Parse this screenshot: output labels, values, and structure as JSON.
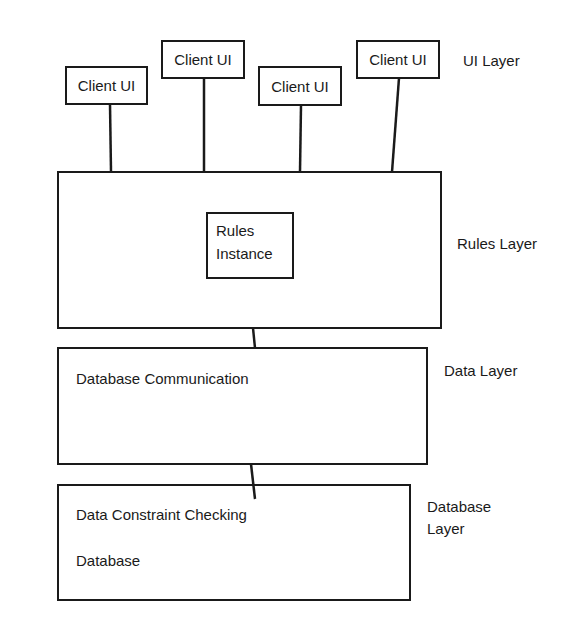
{
  "diagram": {
    "type": "layered-architecture",
    "clients": [
      {
        "label": "Client UI"
      },
      {
        "label": "Client UI"
      },
      {
        "label": "Client UI"
      },
      {
        "label": "Client UI"
      }
    ],
    "rules_box": {
      "instance_line1": "Rules",
      "instance_line2": "Instance"
    },
    "data_box": {
      "text": "Database Communication"
    },
    "database_box": {
      "text1": "Data Constraint Checking",
      "text2": "Database"
    },
    "layer_labels": {
      "ui": "UI Layer",
      "rules": "Rules Layer",
      "data": "Data Layer",
      "database_line1": "Database",
      "database_line2": "Layer"
    },
    "colors": {
      "stroke": "#1a1a1a",
      "background": "#ffffff"
    }
  }
}
